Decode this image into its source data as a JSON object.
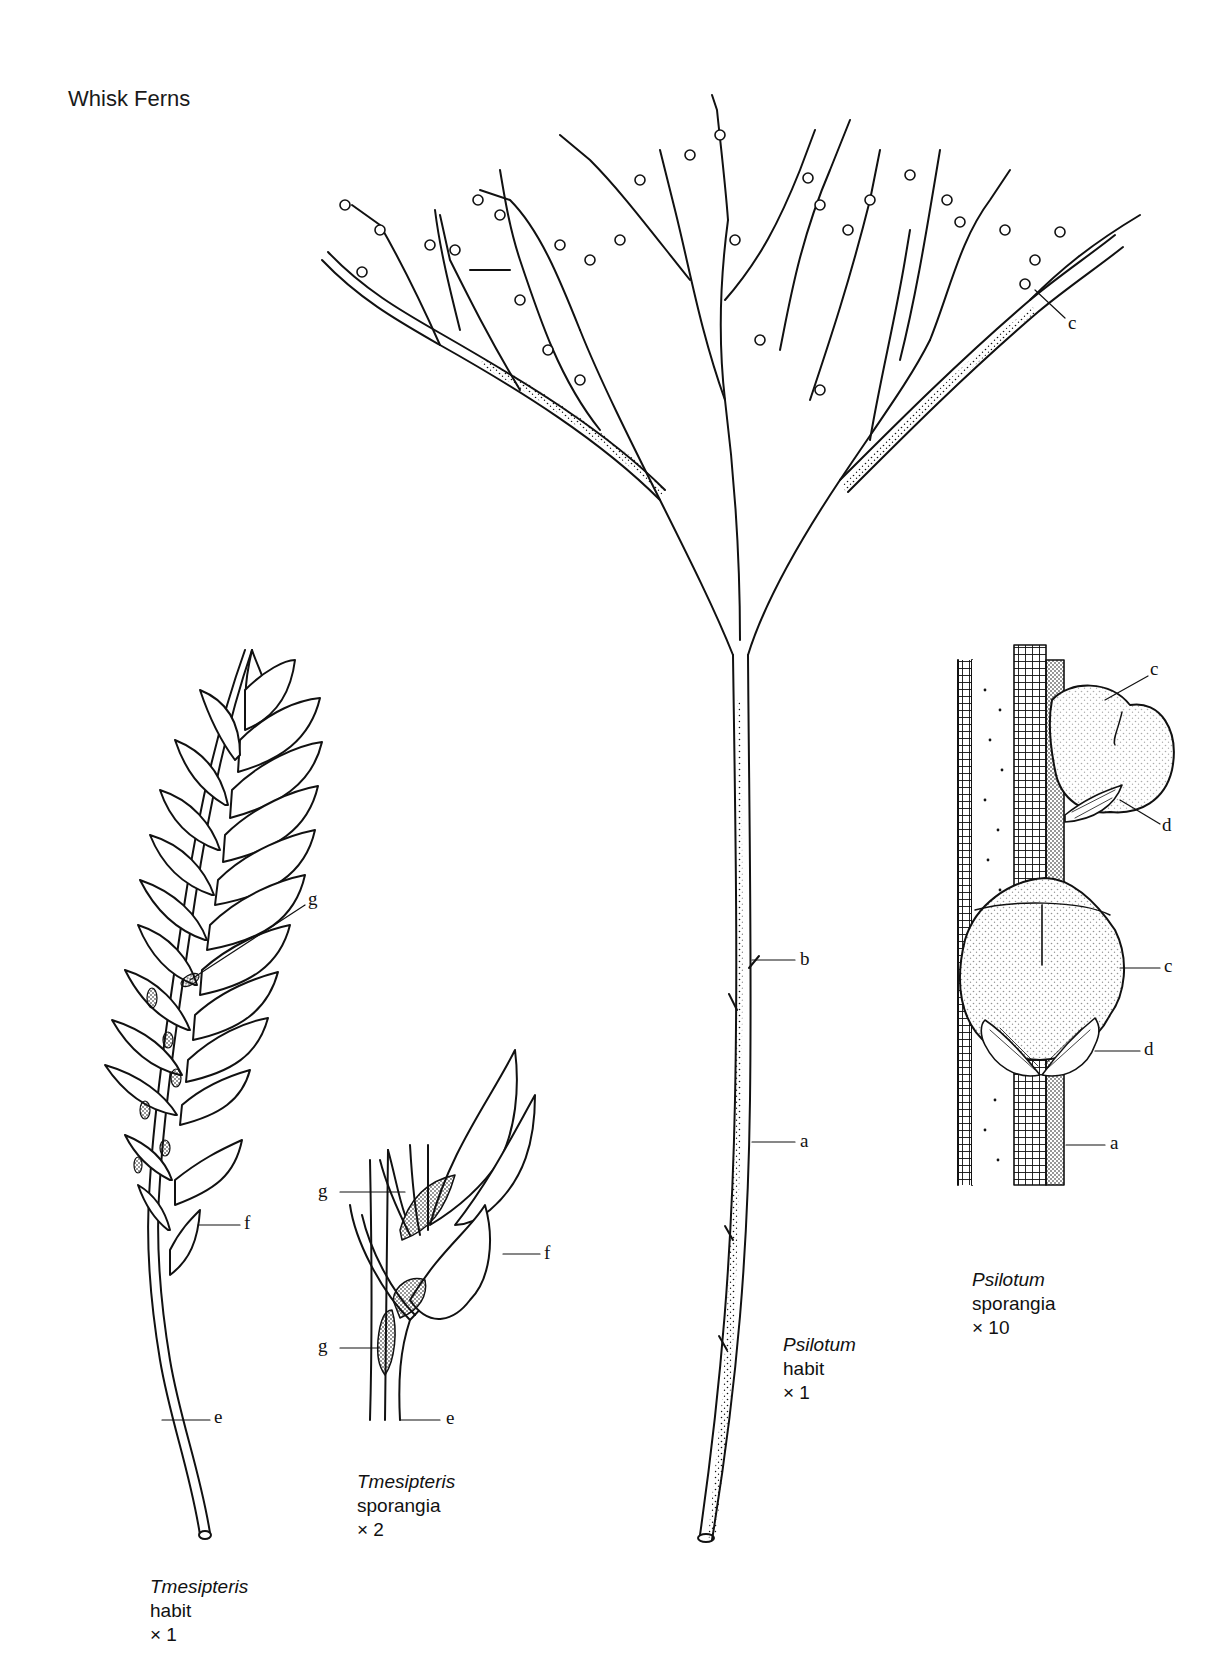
{
  "plate": {
    "title": "Whisk Ferns"
  },
  "figures": [
    {
      "id": "tmesipteris-habit",
      "genus": "Tmesipteris",
      "view": "habit",
      "magnification": "× 1",
      "labels": [
        "g",
        "f",
        "e"
      ]
    },
    {
      "id": "tmesipteris-sporangia",
      "genus": "Tmesipteris",
      "view": "sporangia",
      "magnification": "× 2",
      "labels": [
        "g",
        "g",
        "f",
        "e"
      ]
    },
    {
      "id": "psilotum-habit",
      "genus": "Psilotum",
      "view": "habit",
      "magnification": "× 1",
      "labels": [
        "c",
        "b",
        "a"
      ]
    },
    {
      "id": "psilotum-sporangia",
      "genus": "Psilotum",
      "view": "sporangia",
      "magnification": "× 10",
      "labels": [
        "c",
        "d",
        "c",
        "d",
        "a"
      ]
    }
  ],
  "callouts": {
    "tm_habit_g": "g",
    "tm_habit_f": "f",
    "tm_habit_e": "e",
    "tm_spor_g1": "g",
    "tm_spor_g2": "g",
    "tm_spor_f": "f",
    "tm_spor_e": "e",
    "ps_habit_c": "c",
    "ps_habit_b": "b",
    "ps_habit_a": "a",
    "ps_spor_c1": "c",
    "ps_spor_d1": "d",
    "ps_spor_c2": "c",
    "ps_spor_d2": "d",
    "ps_spor_a": "a"
  },
  "colors": {
    "ink": "#111111",
    "paper": "#ffffff"
  }
}
